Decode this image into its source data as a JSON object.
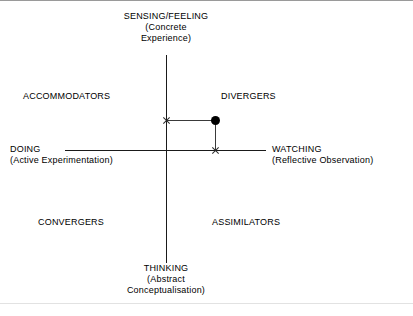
{
  "diagram": {
    "poles": {
      "top": {
        "name": "SENSING/FEELING",
        "sub_line1": "(Concrete",
        "sub_line2": "Experience)"
      },
      "bottom": {
        "name": "THINKING",
        "sub_line1": "(Abstract",
        "sub_line2": "Conceptualisation)"
      },
      "left": {
        "name": "DOING",
        "sub_line1": "(Active Experimentation)",
        "sub_line2": ""
      },
      "right": {
        "name": "WATCHING",
        "sub_line1": "(Reflective Observation)",
        "sub_line2": ""
      }
    },
    "quadrants": {
      "top_left": "ACCOMMODATORS",
      "top_right": "DIVERGERS",
      "bottom_left": "CONVERGERS",
      "bottom_right": "ASSIMILATORS"
    },
    "colors": {
      "axis": "#1a1a1a",
      "connector": "#3a3a3a",
      "marker": "#000000",
      "frame": "#9a9a9a",
      "background": "#ffffff"
    }
  },
  "chart_data": {
    "type": "scatter",
    "xlabel": "DOING (Active Experimentation) ↔ WATCHING (Reflective Observation)",
    "ylabel": "THINKING (Abstract Conceptualisation) ↔ SENSING/FEELING (Concrete Experience)",
    "grid": false,
    "legend": "none",
    "axes": {
      "vertical_axis_label_top": "SENSING/FEELING (Concrete Experience)",
      "vertical_axis_label_bottom": "THINKING (Abstract Conceptualisation)",
      "horizontal_axis_label_left": "DOING (Active Experimentation)",
      "horizontal_axis_label_right": "WATCHING (Reflective Observation)"
    },
    "quadrant_labels": [
      "ACCOMMODATORS",
      "DIVERGERS",
      "CONVERGERS",
      "ASSIMILATORS"
    ],
    "points": [
      {
        "name": "plotted-result",
        "marker": "filled-circle",
        "quadrant": "DIVERGERS",
        "x_px": 215,
        "y_px": 120,
        "origin_px": {
          "x": 166,
          "y": 150
        },
        "x_offset_px": 49,
        "y_offset_px": 30
      }
    ],
    "markers": [
      {
        "name": "vertical-axis-projection",
        "marker": "x",
        "x_px": 166,
        "y_px": 120
      },
      {
        "name": "horizontal-axis-projection",
        "marker": "x",
        "x_px": 215,
        "y_px": 150
      }
    ]
  }
}
